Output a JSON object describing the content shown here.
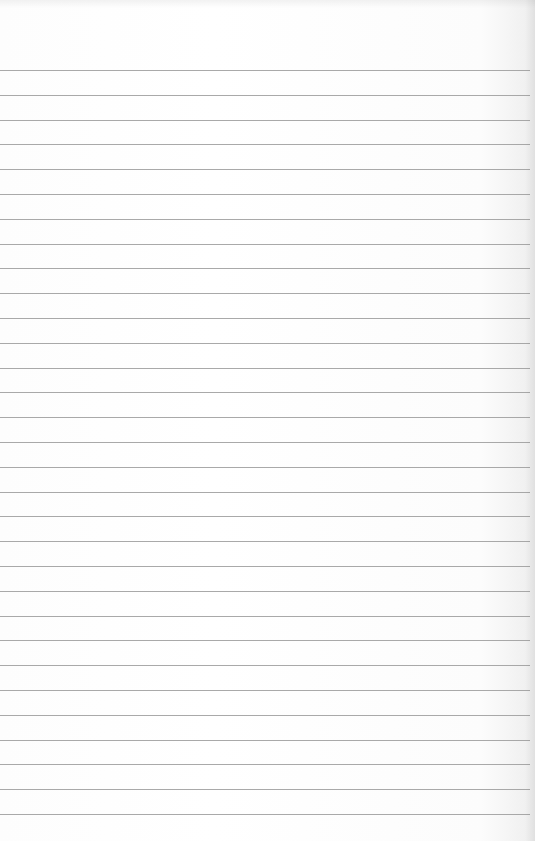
{
  "document": {
    "type": "blank lined paper",
    "text_content": "",
    "paper_color": "#ffffff",
    "rule_color": "#9a9a9a",
    "rules": {
      "count": 31,
      "first_y": 70,
      "spacing": 24.8,
      "width": 530
    }
  }
}
